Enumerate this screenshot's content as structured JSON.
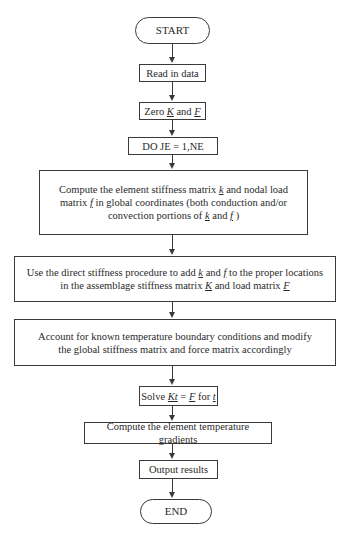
{
  "flowchart": {
    "start": "START",
    "read": "Read in data",
    "zero": {
      "prefix": "Zero ",
      "K": "K",
      "mid": " and ",
      "F": "F"
    },
    "loop": "DO JE = 1,NE",
    "compute_k": {
      "p1": "Compute the element stiffness matrix ",
      "k": "k",
      "p2": " and nodal load matrix ",
      "f": "f",
      "p3": " in global coordinates (both conduction and/or convection portions of ",
      "k2": "k",
      "p4": " and ",
      "f2": "f",
      "p5": " )"
    },
    "assemble": {
      "p1": "Use the direct stiffness procedure to add ",
      "k": "k",
      "p2": " and ",
      "f": "f",
      "p3": " to the proper locations in the assemblage stiffness matrix ",
      "K": "K",
      "p4": " and load matrix ",
      "F": "F"
    },
    "boundary": "Account for known temperature boundary conditions and modify the global stiffness matrix and force matrix accordingly",
    "solve": {
      "p1": "Solve ",
      "Kt": "Kt",
      "eq": " = ",
      "F": "F",
      "p2": " for ",
      "t": "t"
    },
    "gradients": "Compute the element temperature gradients",
    "output": "Output results",
    "end": "END"
  }
}
